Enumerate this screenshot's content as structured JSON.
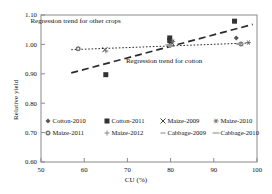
{
  "chart_data": {
    "type": "scatter",
    "title": "",
    "xlabel": "CU (%)",
    "ylabel": "Relative yield",
    "xlim": [
      50,
      100
    ],
    "ylim": [
      0.6,
      1.1
    ],
    "xticks": [
      "50",
      "60",
      "70",
      "80",
      "90",
      "100"
    ],
    "yticks": [
      "0.60",
      "0.70",
      "0.80",
      "0.90",
      "1.00",
      "1.10"
    ],
    "grid": false,
    "legend_position": "inside-bottom-left",
    "series": [
      {
        "name": "Cotton-2010",
        "marker": "diamond",
        "color": "#555555",
        "points": [
          {
            "x": 80.0,
            "y": 1.005
          },
          {
            "x": 95.2,
            "y": 1.022
          }
        ]
      },
      {
        "name": "Cotton-2011",
        "marker": "square",
        "color": "#333333",
        "points": [
          {
            "x": 65.0,
            "y": 0.897
          },
          {
            "x": 79.8,
            "y": 1.022
          },
          {
            "x": 79.8,
            "y": 1.013
          },
          {
            "x": 94.8,
            "y": 1.079
          }
        ]
      },
      {
        "name": "Maize-2009",
        "marker": "cross-x",
        "color": "#444444",
        "points": [
          {
            "x": 64.8,
            "y": 0.982
          },
          {
            "x": 80.2,
            "y": 1.006
          }
        ]
      },
      {
        "name": "Maize-2010",
        "marker": "asterisk",
        "color": "#666666",
        "points": [
          {
            "x": 80.5,
            "y": 1.01
          },
          {
            "x": 98.0,
            "y": 1.006
          }
        ]
      },
      {
        "name": "Maize-2011",
        "marker": "circle-dot",
        "color": "#777777",
        "points": [
          {
            "x": 58.6,
            "y": 0.985
          },
          {
            "x": 96.3,
            "y": 1.001
          }
        ]
      },
      {
        "name": "Maize-2012",
        "marker": "plus",
        "color": "#888888",
        "points": [
          {
            "x": 65.0,
            "y": 0.978
          },
          {
            "x": 80.0,
            "y": 0.996
          }
        ]
      },
      {
        "name": "Cabbage-2009",
        "marker": "dash",
        "color": "#999999",
        "points": [
          {
            "x": 80.0,
            "y": 0.993
          },
          {
            "x": 95.8,
            "y": 1.0
          }
        ]
      },
      {
        "name": "Cabbage-2010",
        "marker": "dash-long",
        "color": "#999999",
        "points": [
          {
            "x": 79.6,
            "y": 0.999
          },
          {
            "x": 96.0,
            "y": 1.003
          }
        ]
      }
    ],
    "trendlines": [
      {
        "name": "other-crops",
        "label": "Regression trend for other crops",
        "style": "dotted",
        "x1": 57.0,
        "y1": 0.982,
        "x2": 98.5,
        "y2": 1.005
      },
      {
        "name": "cotton",
        "label": "Regression trend for cotton",
        "style": "dashed",
        "x1": 57.0,
        "y1": 0.903,
        "x2": 99.0,
        "y2": 1.068
      }
    ],
    "annotations": [
      {
        "name": "other-crops-label",
        "text": "Regression trend for other crops",
        "x": 58.0,
        "y": 1.072
      },
      {
        "name": "cotton-label",
        "text": "Regression trend for cotton",
        "x": 78.5,
        "y": 0.938
      }
    ],
    "legend": [
      {
        "label": "Cotton-2010",
        "marker": "diamond"
      },
      {
        "label": "Cotton-2011",
        "marker": "square"
      },
      {
        "label": "Maize-2009",
        "marker": "cross-x"
      },
      {
        "label": "Maize-2010",
        "marker": "asterisk"
      },
      {
        "label": "Maize-2011",
        "marker": "circle-dot"
      },
      {
        "label": "Maize-2012",
        "marker": "plus"
      },
      {
        "label": "Cabbage-2009",
        "marker": "dash"
      },
      {
        "label": "Cabbage-2010",
        "marker": "dash-long"
      }
    ]
  }
}
